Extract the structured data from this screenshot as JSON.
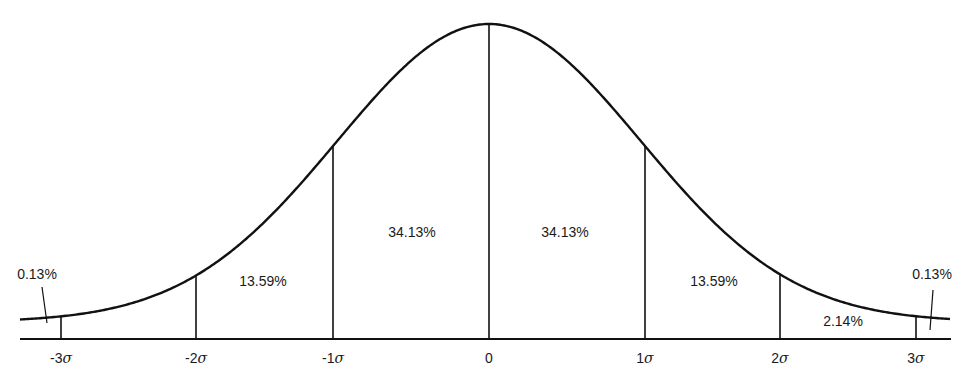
{
  "chart_data": {
    "type": "area",
    "title": "",
    "xlabel": "",
    "ylabel": "",
    "x_ticks": [
      "-3σ",
      "-2σ",
      "-1σ",
      "0",
      "1σ",
      "2σ",
      "3σ"
    ],
    "regions": [
      {
        "from": "-∞",
        "to": "-3σ",
        "percent": 0.13,
        "label": "0.13%"
      },
      {
        "from": "-3σ",
        "to": "-2σ",
        "percent": 2.14,
        "label": ""
      },
      {
        "from": "-2σ",
        "to": "-1σ",
        "percent": 13.59,
        "label": "13.59%"
      },
      {
        "from": "-1σ",
        "to": "0",
        "percent": 34.13,
        "label": "34.13%"
      },
      {
        "from": "0",
        "to": "1σ",
        "percent": 34.13,
        "label": "34.13%"
      },
      {
        "from": "1σ",
        "to": "2σ",
        "percent": 13.59,
        "label": "13.59%"
      },
      {
        "from": "2σ",
        "to": "3σ",
        "percent": 2.14,
        "label": "2.14%"
      },
      {
        "from": "3σ",
        "to": "∞",
        "percent": 0.13,
        "label": "0.13%"
      }
    ],
    "grid": false,
    "legend": null
  },
  "labels": {
    "left_tail": "0.13%",
    "left_2": "13.59%",
    "left_1": "34.13%",
    "right_1": "34.13%",
    "right_2": "13.59%",
    "right_3": "2.14%",
    "right_tail": "0.13%"
  },
  "ticks": {
    "m3": {
      "num": "-3",
      "sym": "σ"
    },
    "m2": {
      "num": "-2",
      "sym": "σ"
    },
    "m1": {
      "num": "-1",
      "sym": "σ"
    },
    "zero": {
      "num": "0",
      "sym": ""
    },
    "p1": {
      "num": "1",
      "sym": "σ"
    },
    "p2": {
      "num": "2",
      "sym": "σ"
    },
    "p3": {
      "num": "3",
      "sym": "σ"
    }
  },
  "colors": {
    "line": "#111111",
    "background": "#ffffff"
  }
}
